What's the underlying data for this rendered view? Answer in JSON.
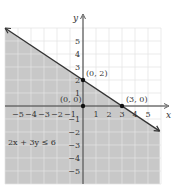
{
  "chart_data": {
    "type": "line",
    "title": "",
    "inequality": "2x + 3y ≤ 6",
    "boundary_line": {
      "equation": "2x + 3y = 6",
      "slope": -0.6667,
      "intercept": 2
    },
    "shaded_region": "below line",
    "points": [
      {
        "label": "(0, 2)",
        "x": 0,
        "y": 2
      },
      {
        "label": "(0, 0)",
        "x": 0,
        "y": 0
      },
      {
        "label": "(3, 0)",
        "x": 3,
        "y": 0
      }
    ],
    "xlabel": "x",
    "ylabel": "y",
    "xlim": [
      -6,
      6
    ],
    "ylim": [
      -6,
      6
    ],
    "x_ticks": [
      -5,
      -4,
      -3,
      -2,
      -1,
      1,
      2,
      3,
      4,
      5
    ],
    "y_ticks": [
      -5,
      -4,
      -3,
      -2,
      -1,
      1,
      2,
      3,
      4,
      5
    ],
    "grid": true
  },
  "colors": {
    "shade": "#c8c8c8",
    "grid": "#e4e4e4",
    "line": "#333333"
  }
}
